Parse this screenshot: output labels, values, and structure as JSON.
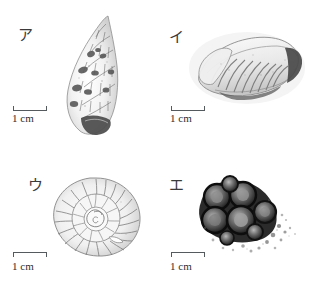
{
  "figure": {
    "background_color": "#ffffff",
    "ink_color": "#4a4a4a",
    "layout": "2x2 grid of grayscale fossil specimen photographs"
  },
  "panels": [
    {
      "id": "a",
      "label": "ア",
      "specimen_name": "spiny-gastropod-shell",
      "specimen_description": "tall pointed spiral sea snail shell with spines",
      "scale": {
        "length_label": "1 cm",
        "bracket": "up"
      }
    },
    {
      "id": "i",
      "label": "イ",
      "specimen_name": "trilobite-fossil",
      "specimen_description": "segmented trilobite body fossil, ribbed thorax",
      "scale": {
        "length_label": "1 cm",
        "bracket": "up"
      }
    },
    {
      "id": "u",
      "label": "ウ",
      "specimen_name": "ammonite-fossil",
      "specimen_description": "coiled ammonite shell with radial ribs",
      "scale": {
        "length_label": "1 cm",
        "bracket": "down"
      }
    },
    {
      "id": "e",
      "label": "エ",
      "specimen_name": "coral-colony-fossil",
      "specimen_description": "cluster of dark rounded coral corallites in matrix",
      "scale": {
        "length_label": "1 cm",
        "bracket": "down"
      }
    }
  ]
}
